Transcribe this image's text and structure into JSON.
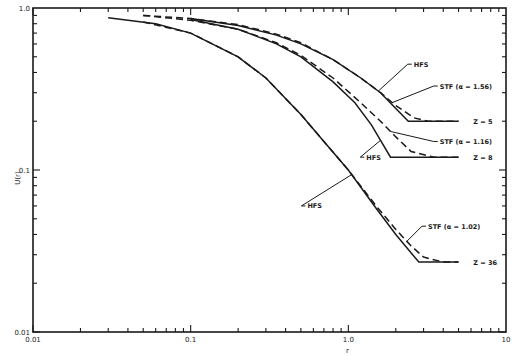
{
  "chart_data": {
    "type": "line",
    "title": "",
    "xlabel": "r",
    "ylabel": "U(r)",
    "xscale": "log",
    "yscale": "log",
    "xlim": [
      0.01,
      10
    ],
    "ylim": [
      0.01,
      1.0
    ],
    "grid": false,
    "legend": "none (curves labeled inline)",
    "x_tick_labels": [
      "0.01",
      "0.1",
      "1.0",
      "10"
    ],
    "y_tick_labels": [
      "0.01",
      "0.1",
      "1.0"
    ],
    "series": [
      {
        "name": "Z = 5 HFS",
        "style": "solid",
        "x": [
          0.1,
          0.2,
          0.35,
          0.5,
          0.8,
          1.2,
          1.6,
          2.0,
          2.4,
          5.0
        ],
        "y": [
          0.86,
          0.78,
          0.68,
          0.6,
          0.48,
          0.37,
          0.3,
          0.24,
          0.2,
          0.2
        ]
      },
      {
        "name": "Z = 5 STF (α = 1.56)",
        "style": "dashed",
        "x": [
          0.05,
          0.1,
          0.2,
          0.35,
          0.5,
          0.8,
          1.2,
          1.6,
          2.0,
          2.6,
          3.2,
          5.0
        ],
        "y": [
          0.9,
          0.86,
          0.79,
          0.69,
          0.61,
          0.48,
          0.37,
          0.3,
          0.25,
          0.21,
          0.2,
          0.2
        ]
      },
      {
        "name": "Z = 8 HFS",
        "style": "solid",
        "x": [
          0.1,
          0.2,
          0.35,
          0.5,
          0.8,
          1.1,
          1.4,
          1.85,
          5.0
        ],
        "y": [
          0.85,
          0.74,
          0.6,
          0.5,
          0.35,
          0.26,
          0.19,
          0.12,
          0.12
        ]
      },
      {
        "name": "Z = 8 STF (α = 1.16)",
        "style": "dashed",
        "x": [
          0.05,
          0.1,
          0.2,
          0.35,
          0.5,
          0.8,
          1.2,
          1.6,
          2.0,
          2.5,
          3.5,
          5.0
        ],
        "y": [
          0.9,
          0.84,
          0.74,
          0.61,
          0.51,
          0.37,
          0.26,
          0.2,
          0.16,
          0.13,
          0.12,
          0.12
        ]
      },
      {
        "name": "Z = 36 HFS",
        "style": "solid",
        "x": [
          0.03,
          0.06,
          0.1,
          0.2,
          0.3,
          0.5,
          0.7,
          1.0,
          1.5,
          2.0,
          2.8,
          5.0
        ],
        "y": [
          0.87,
          0.8,
          0.7,
          0.5,
          0.37,
          0.22,
          0.15,
          0.1,
          0.058,
          0.04,
          0.027,
          0.027
        ]
      },
      {
        "name": "Z = 36 STF (α = 1.02)",
        "style": "dashed",
        "x": [
          0.05,
          0.1,
          0.2,
          0.3,
          0.5,
          0.7,
          1.0,
          1.5,
          2.0,
          2.5,
          3.0,
          4.0,
          5.0
        ],
        "y": [
          0.82,
          0.7,
          0.5,
          0.37,
          0.22,
          0.15,
          0.1,
          0.06,
          0.043,
          0.034,
          0.029,
          0.027,
          0.027
        ]
      }
    ],
    "annotations": [
      {
        "text": "HFS",
        "x": 2.6,
        "y": 0.45,
        "points_to": "Z = 5 HFS"
      },
      {
        "text": "STF (α = 1.56)",
        "x": 3.8,
        "y": 0.33,
        "points_to": "Z = 5 STF"
      },
      {
        "text": "Z = 5",
        "x": 6.2,
        "y": 0.2
      },
      {
        "text": "STF (α = 1.16)",
        "x": 3.8,
        "y": 0.15,
        "points_to": "Z = 8 STF"
      },
      {
        "text": "HFS",
        "x": 1.3,
        "y": 0.12,
        "points_to": "Z = 8 HFS"
      },
      {
        "text": "Z = 8",
        "x": 6.2,
        "y": 0.12
      },
      {
        "text": "HFS",
        "x": 0.55,
        "y": 0.06,
        "points_to": "Z = 36 HFS"
      },
      {
        "text": "STF (α = 1.02)",
        "x": 3.2,
        "y": 0.045,
        "points_to": "Z = 36 STF"
      },
      {
        "text": "Z = 36",
        "x": 6.2,
        "y": 0.027
      }
    ]
  },
  "labels": {
    "xlabel": "r",
    "ylabel": "U(r)",
    "z5": "Z = 5",
    "z8": "Z = 8",
    "z36": "Z = 36",
    "hfs": "HFS",
    "stf156": "STF (α = 1.56)",
    "stf116": "STF (α = 1.16)",
    "stf102": "STF (α = 1.02)"
  }
}
